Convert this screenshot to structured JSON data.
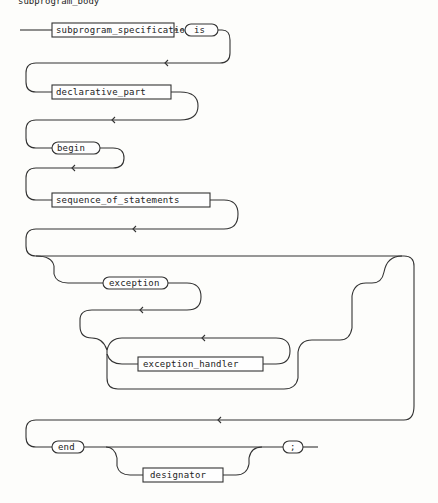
{
  "heading": "subprogram_body",
  "diagram": {
    "type": "railroad-syntax-diagram",
    "nonterminals": {
      "subprogram_specification": "subprogram_specification",
      "declarative_part": "declarative_part",
      "sequence_of_statements": "sequence_of_statements",
      "exception_handler": "exception_handler",
      "designator": "designator"
    },
    "terminals": {
      "is": "is",
      "begin": "begin",
      "exception": "exception",
      "end": "end",
      "semicolon": ";"
    },
    "colors": {
      "line": "#333333",
      "background": "#fdfdfb"
    }
  }
}
